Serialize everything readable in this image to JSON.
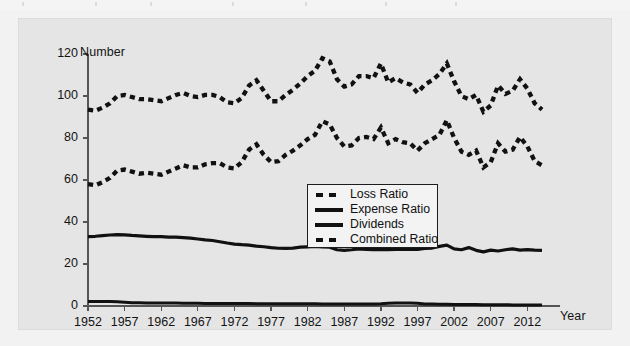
{
  "figure": {
    "background_color": "#e5e5e5",
    "page_color": "#f2f2f2",
    "series_color": "#111111"
  },
  "axes": {
    "ylabel": "Number",
    "xlabel": "Year",
    "yticks": [
      "0",
      "20",
      "40",
      "60",
      "80",
      "100",
      "120"
    ],
    "xticks": [
      "1952",
      "1957",
      "1962",
      "1967",
      "1972",
      "1977",
      "1982",
      "1987",
      "1992",
      "1997",
      "2002",
      "2007",
      "2012"
    ]
  },
  "legend": {
    "items": [
      {
        "label": "Loss Ratio",
        "style": "dashed"
      },
      {
        "label": "Expense Ratio",
        "style": "solid"
      },
      {
        "label": "Dividends",
        "style": "solid"
      },
      {
        "label": "Combined Ratio",
        "style": "dashed"
      }
    ]
  },
  "chart_data": {
    "type": "line",
    "title": "",
    "xlabel": "Year",
    "ylabel": "Number",
    "xlim": [
      1952,
      2014
    ],
    "ylim": [
      0,
      120
    ],
    "grid": false,
    "legend_position": "center",
    "x": [
      1952,
      1953,
      1954,
      1955,
      1956,
      1957,
      1958,
      1959,
      1960,
      1961,
      1962,
      1963,
      1964,
      1965,
      1966,
      1967,
      1968,
      1969,
      1970,
      1971,
      1972,
      1973,
      1974,
      1975,
      1976,
      1977,
      1978,
      1979,
      1980,
      1981,
      1982,
      1983,
      1984,
      1985,
      1986,
      1987,
      1988,
      1989,
      1990,
      1991,
      1992,
      1993,
      1994,
      1995,
      1996,
      1997,
      1998,
      1999,
      2000,
      2001,
      2002,
      2003,
      2004,
      2005,
      2006,
      2007,
      2008,
      2009,
      2010,
      2011,
      2012,
      2013,
      2014
    ],
    "series": [
      {
        "name": "Combined Ratio",
        "style": "dashed",
        "values": [
          93.5,
          93.0,
          94.5,
          96.5,
          100.0,
          100.5,
          99.5,
          98.5,
          98.5,
          98.0,
          97.5,
          99.0,
          100.5,
          101.5,
          100.0,
          99.5,
          100.5,
          100.5,
          99.5,
          97.0,
          96.5,
          99.0,
          105.0,
          107.5,
          102.5,
          97.5,
          97.5,
          100.5,
          103.0,
          106.0,
          109.5,
          112.0,
          118.0,
          116.5,
          108.0,
          104.5,
          105.5,
          109.5,
          109.5,
          108.5,
          115.5,
          106.5,
          108.5,
          106.5,
          105.5,
          101.5,
          105.5,
          107.5,
          110.5,
          115.5,
          107.0,
          100.0,
          98.5,
          100.5,
          92.5,
          95.5,
          105.0,
          101.0,
          102.5,
          108.0,
          103.5,
          96.5,
          93.5
        ]
      },
      {
        "name": "Loss Ratio",
        "style": "dashed",
        "values": [
          58.0,
          57.5,
          59.0,
          61.0,
          64.5,
          65.0,
          64.0,
          63.0,
          63.5,
          63.0,
          62.5,
          64.0,
          65.5,
          67.0,
          66.0,
          66.0,
          67.5,
          68.0,
          68.0,
          66.0,
          65.5,
          68.5,
          74.5,
          77.0,
          72.0,
          68.5,
          69.0,
          72.0,
          74.0,
          76.5,
          79.5,
          81.5,
          88.0,
          86.5,
          80.0,
          76.0,
          76.5,
          80.0,
          80.5,
          79.5,
          85.0,
          77.5,
          79.5,
          78.0,
          77.5,
          74.0,
          77.5,
          79.5,
          81.5,
          88.5,
          80.0,
          73.5,
          72.0,
          74.0,
          66.0,
          68.5,
          77.5,
          73.5,
          74.5,
          80.5,
          76.0,
          69.0,
          67.0
        ]
      },
      {
        "name": "Expense Ratio",
        "style": "solid",
        "values": [
          33.0,
          33.2,
          33.5,
          33.8,
          34.0,
          33.9,
          33.6,
          33.4,
          33.2,
          33.0,
          33.0,
          32.8,
          32.8,
          32.6,
          32.3,
          31.9,
          31.5,
          31.2,
          30.6,
          30.0,
          29.5,
          29.2,
          29.0,
          28.5,
          28.2,
          27.8,
          27.5,
          27.4,
          27.6,
          28.0,
          28.2,
          28.4,
          28.2,
          28.0,
          26.8,
          26.5,
          26.8,
          27.2,
          27.0,
          26.8,
          27.0,
          26.8,
          26.9,
          27.0,
          27.0,
          27.0,
          27.4,
          27.6,
          28.4,
          29.0,
          27.2,
          26.8,
          27.8,
          26.5,
          25.8,
          26.6,
          26.2,
          26.8,
          27.2,
          26.6,
          26.8,
          26.6,
          26.5
        ]
      },
      {
        "name": "Dividends",
        "style": "solid",
        "values": [
          2.2,
          2.2,
          2.1,
          2.1,
          2.0,
          1.8,
          1.5,
          1.5,
          1.4,
          1.4,
          1.4,
          1.4,
          1.4,
          1.3,
          1.3,
          1.3,
          1.2,
          1.2,
          1.2,
          1.2,
          1.2,
          1.2,
          1.2,
          1.1,
          1.1,
          1.1,
          1.1,
          1.1,
          1.1,
          1.1,
          1.1,
          1.1,
          1.0,
          1.0,
          1.0,
          1.0,
          1.0,
          1.0,
          1.0,
          1.0,
          1.1,
          1.3,
          1.4,
          1.4,
          1.4,
          1.3,
          1.0,
          0.9,
          0.8,
          0.8,
          0.7,
          0.7,
          0.7,
          0.7,
          0.6,
          0.6,
          0.6,
          0.6,
          0.5,
          0.5,
          0.5,
          0.5,
          0.5
        ]
      }
    ]
  }
}
